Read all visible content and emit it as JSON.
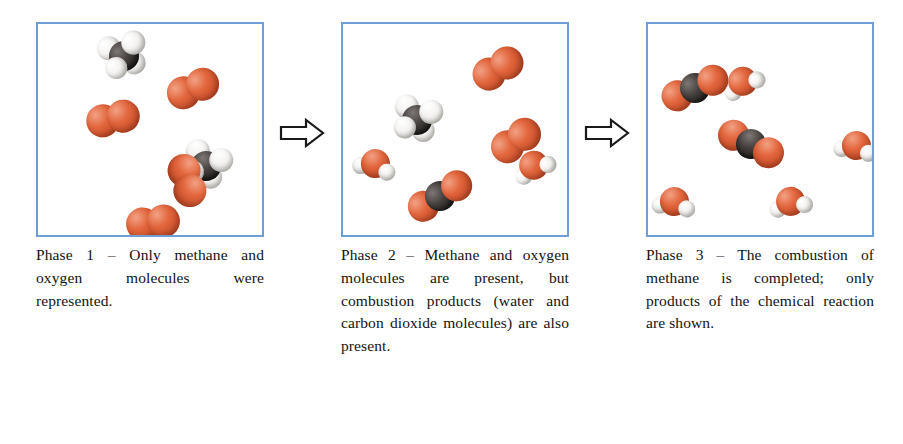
{
  "figure": {
    "border_color": "#6f9ed6",
    "atom_colors": {
      "oxygen": "#e2663d",
      "carbon": "#2b2725",
      "hydrogen": "#f4f3f1"
    }
  },
  "arrows": [
    {
      "name": "arrow-phase-1-to-2",
      "direction": "right"
    },
    {
      "name": "arrow-phase-2-to-3",
      "direction": "right"
    }
  ],
  "panels": [
    {
      "id": "phase-1",
      "caption": "Phase 1 – Only methane and oxygen molecules were represented.",
      "molecules": [
        {
          "species": "methane",
          "formula": "CH4",
          "x": 60,
          "y": 8,
          "rotation": -18
        },
        {
          "species": "oxygen",
          "formula": "O2",
          "x": 128,
          "y": 48,
          "rotation": -24
        },
        {
          "species": "oxygen",
          "formula": "O2",
          "x": 48,
          "y": 78,
          "rotation": -13
        },
        {
          "species": "methane",
          "formula": "CH4",
          "x": 142,
          "y": 118,
          "rotation": 16
        },
        {
          "species": "oxygen",
          "formula": "O2",
          "x": 122,
          "y": 140,
          "rotation": 74
        },
        {
          "species": "oxygen",
          "formula": "O2",
          "x": 88,
          "y": 182,
          "rotation": -8
        }
      ]
    },
    {
      "id": "phase-2",
      "caption": "Phase 2 – Methane and oxygen molecules are present, but combustion products (water and carbon dioxide molecules) are also present.",
      "molecules": [
        {
          "species": "oxygen",
          "formula": "O2",
          "x": 128,
          "y": 28,
          "rotation": -32
        },
        {
          "species": "methane",
          "formula": "CH4",
          "x": 48,
          "y": 72,
          "rotation": 8
        },
        {
          "species": "water",
          "formula": "H2O",
          "x": 10,
          "y": 122,
          "rotation": 12
        },
        {
          "species": "oxygen",
          "formula": "O2",
          "x": 146,
          "y": 100,
          "rotation": -36
        },
        {
          "species": "water",
          "formula": "H2O",
          "x": 168,
          "y": 124,
          "rotation": -28
        },
        {
          "species": "carbon dioxide",
          "formula": "CO2",
          "x": 62,
          "y": 156,
          "rotation": -30
        }
      ]
    },
    {
      "id": "phase-3",
      "caption": "Phase 3 – The combustion of methane is completed; only products of the chemical reaction are shown.",
      "molecules": [
        {
          "species": "carbon dioxide",
          "formula": "CO2",
          "x": 12,
          "y": 48,
          "rotation": -22
        },
        {
          "species": "water",
          "formula": "H2O",
          "x": 72,
          "y": 40,
          "rotation": -30
        },
        {
          "species": "carbon dioxide",
          "formula": "CO2",
          "x": 68,
          "y": 104,
          "rotation": 28
        },
        {
          "species": "water",
          "formula": "H2O",
          "x": 186,
          "y": 104,
          "rotation": 8
        },
        {
          "species": "water",
          "formula": "H2O",
          "x": 4,
          "y": 160,
          "rotation": 6
        },
        {
          "species": "water",
          "formula": "H2O",
          "x": 120,
          "y": 160,
          "rotation": -12
        }
      ]
    }
  ]
}
